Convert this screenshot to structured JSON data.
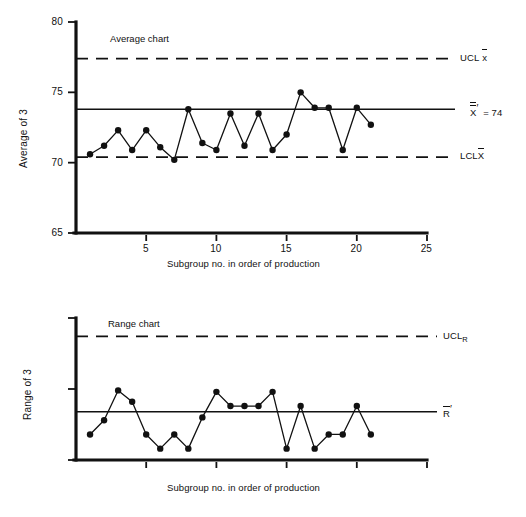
{
  "figure": {
    "xaxis_title": "Subgroup no. in order of production",
    "xticks": [
      5,
      10,
      15,
      20,
      25
    ]
  },
  "average_chart": {
    "inner_title": "Average chart",
    "yaxis_title": "Average of 3",
    "yticks": [
      65,
      70,
      75,
      80
    ],
    "ucl_label_prefix": "UCL",
    "ucl_label_sub": "x",
    "lcl_label_prefix": "LCL",
    "lcl_label_sub": "X",
    "center_label_symbol": "X",
    "center_label_value": "= 74"
  },
  "range_chart": {
    "inner_title": "Range chart",
    "yaxis_title": "Range of 3",
    "yticks": [
      0,
      5,
      10
    ],
    "ucl_label_prefix": "UCL",
    "ucl_label_sub": "R",
    "center_label_symbol": "R"
  },
  "chart_data": [
    {
      "type": "line",
      "title": "Average chart",
      "xlabel": "Subgroup no. in order of production",
      "ylabel": "Average of 3",
      "xlim": [
        0,
        25
      ],
      "ylim": [
        65,
        80
      ],
      "grid": false,
      "legend": "none",
      "x": [
        1,
        2,
        3,
        4,
        5,
        6,
        7,
        8,
        9,
        10,
        11,
        12,
        13,
        14,
        15,
        16,
        17,
        18,
        19,
        20,
        21
      ],
      "values": [
        70.6,
        71.2,
        72.3,
        70.9,
        72.3,
        71.1,
        70.2,
        73.8,
        71.4,
        70.9,
        73.5,
        71.2,
        73.5,
        70.9,
        72.0,
        75.0,
        73.9,
        73.9,
        70.9,
        73.9,
        72.7
      ],
      "center_line": 73.8,
      "center_line_label": "X̿′ = 74",
      "upper_control_limit": 77.4,
      "upper_control_limit_label": "UCL x̄",
      "lower_control_limit": 70.4,
      "lower_control_limit_label": "LCL X̄"
    },
    {
      "type": "line",
      "title": "Range chart",
      "xlabel": "Subgroup no. in order of production",
      "ylabel": "Range of 3",
      "xlim": [
        0,
        25
      ],
      "ylim": [
        0,
        10
      ],
      "grid": false,
      "legend": "none",
      "x": [
        1,
        2,
        3,
        4,
        5,
        6,
        7,
        8,
        9,
        10,
        11,
        12,
        13,
        14,
        15,
        16,
        17,
        18,
        19,
        20,
        21
      ],
      "values": [
        1.8,
        2.8,
        4.9,
        4.1,
        1.8,
        0.8,
        1.8,
        0.8,
        3.0,
        4.8,
        3.8,
        3.8,
        3.8,
        4.8,
        0.8,
        3.8,
        0.8,
        1.8,
        1.8,
        3.8,
        1.8
      ],
      "center_line": 3.4,
      "center_line_label": "R̄′",
      "upper_control_limit": 8.7,
      "upper_control_limit_label": "UCL R"
    }
  ]
}
